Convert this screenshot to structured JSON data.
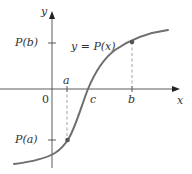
{
  "diagram": {
    "axes": {
      "x_label": "x",
      "y_label": "y",
      "origin_label": "0"
    },
    "curve_label": "y = P(x)",
    "points": {
      "a": "a",
      "b": "b",
      "c": "c",
      "Pa": "P(a)",
      "Pb": "P(b)"
    },
    "colors": {
      "curve": "#6e6e6e",
      "axis": "#4a4a4a",
      "dashed": "#8a8a8a",
      "text": "#333333"
    }
  }
}
